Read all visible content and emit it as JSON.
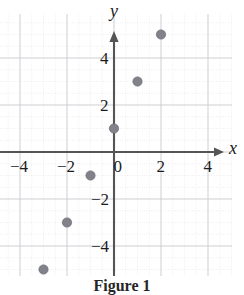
{
  "figure": {
    "caption": "Figure 1",
    "x_axis_label": "x",
    "y_axis_label": "y"
  },
  "axis_ticks": {
    "x": [
      {
        "label": "−4",
        "value": -4
      },
      {
        "label": "−2",
        "value": -2
      },
      {
        "label": "0",
        "value": 0
      },
      {
        "label": "2",
        "value": 2
      },
      {
        "label": "4",
        "value": 4
      }
    ],
    "y": [
      {
        "label": "4",
        "value": 4
      },
      {
        "label": "2",
        "value": 2
      },
      {
        "label": "−2",
        "value": -2
      },
      {
        "label": "−4",
        "value": -4
      }
    ]
  },
  "colors": {
    "point": "#82828a",
    "point_edge": "#6e6e77",
    "axis": "#555555",
    "grid_major": "#c9c9cf",
    "grid_minor": "#dedee4",
    "background": "#ffffff",
    "text": "#1c1c1c"
  },
  "chart_data": {
    "type": "scatter",
    "title": "Figure 1",
    "xlabel": "x",
    "ylabel": "y",
    "xlim": [
      -5.1,
      5.5
    ],
    "ylim": [
      -5.9,
      5.9
    ],
    "grid": true,
    "legend": "none",
    "xticks": [
      -4,
      -2,
      0,
      2,
      4
    ],
    "yticks": [
      4,
      2,
      -2,
      -4
    ],
    "points": [
      {
        "x": -3,
        "y": -5
      },
      {
        "x": -2,
        "y": -3
      },
      {
        "x": -1,
        "y": -1
      },
      {
        "x": 0,
        "y": 1
      },
      {
        "x": 1,
        "y": 3
      },
      {
        "x": 2,
        "y": 5
      }
    ],
    "series": [
      {
        "name": "points",
        "x": [
          -3,
          -2,
          -1,
          0,
          1,
          2
        ],
        "y": [
          -5,
          -3,
          -1,
          1,
          3,
          5
        ]
      }
    ]
  },
  "geometry": {
    "origin_x_px": 114,
    "origin_y_px": 152,
    "unit_px": 23.5,
    "point_radius_px": 4.6
  }
}
